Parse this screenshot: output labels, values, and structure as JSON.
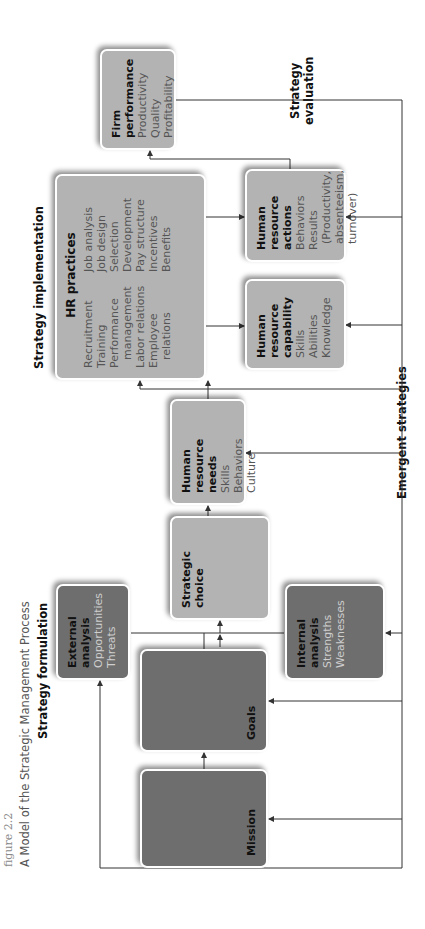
{
  "figure": {
    "label": "figure 2.2",
    "title": "A Model of the Strategic Management Process"
  },
  "sections": {
    "formulation": "Strategy formulation",
    "implementation": "Strategy implementation",
    "evaluation": [
      "Strategy",
      "evaluation"
    ],
    "emergent": "Emergent strategies"
  },
  "boxes": {
    "mission": {
      "title": "Mission"
    },
    "goals": {
      "title": "Goals"
    },
    "external": {
      "title": [
        "External",
        "analysis"
      ],
      "items": [
        "Opportunities",
        "Threats"
      ]
    },
    "internal": {
      "title": [
        "Internal",
        "analysis"
      ],
      "items": [
        "Strengths",
        "Weaknesses"
      ]
    },
    "choice": {
      "title": [
        "Strategic",
        "choice"
      ]
    },
    "needs": {
      "title": [
        "Human",
        "resource",
        "needs"
      ],
      "items": [
        "Skills",
        "Behaviors",
        "Culture"
      ]
    },
    "practices": {
      "title": "HR practices",
      "col1": [
        "Recruitment",
        "Training",
        "Performance management",
        "Labor relations",
        "Employee relations"
      ],
      "col2": [
        "Job analysis",
        "Job design",
        "Selection",
        "Development",
        "Pay structure",
        "Incentives",
        "Benefits"
      ]
    },
    "capability": {
      "title": [
        "Human",
        "resource",
        "capability"
      ],
      "items": [
        "Skills",
        "Abilities",
        "Knowledge"
      ]
    },
    "actions": {
      "title": [
        "Human",
        "resource",
        "actions"
      ],
      "items": [
        "Behaviors",
        "Results",
        "(Productivity, absenteeism, turnover)"
      ]
    },
    "performance": {
      "title": [
        "Firm",
        "performance"
      ],
      "items": [
        "Productivity",
        "Quality",
        "Profitability"
      ]
    }
  },
  "colors": {
    "dark_box": "#6e6e6e",
    "light_box": "#b3b3b3",
    "line": "#333333"
  }
}
